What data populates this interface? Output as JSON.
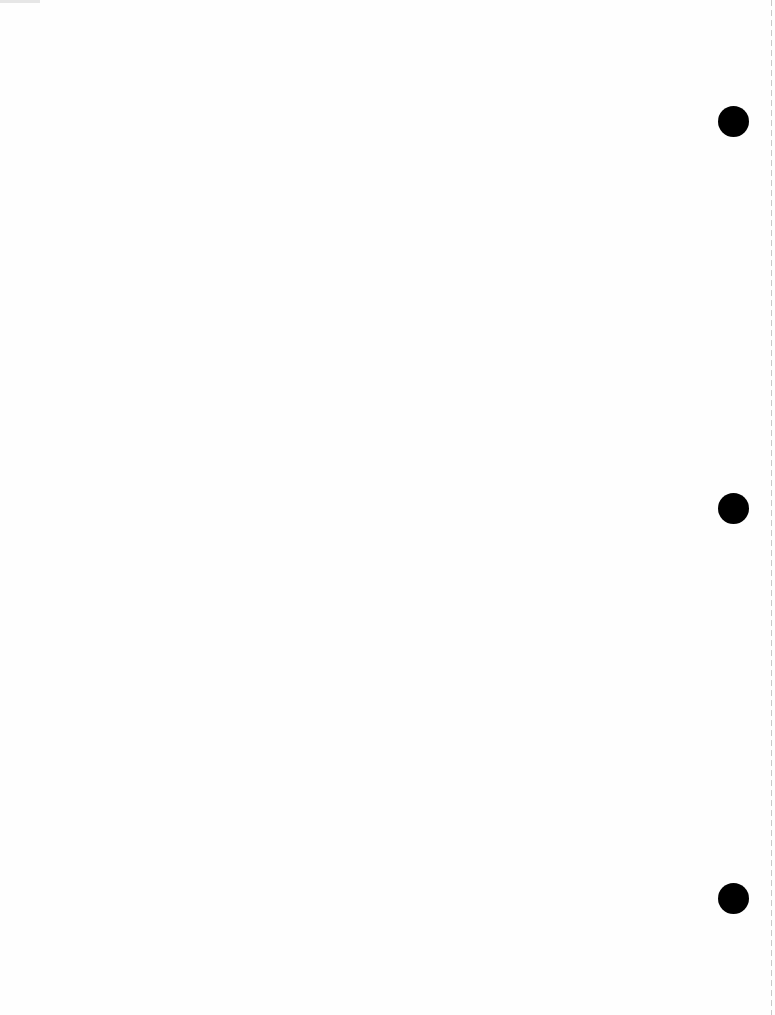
{
  "document": {
    "type": "blank scanned page",
    "text": "",
    "punch_holes": [
      {
        "cx": 733,
        "cy": 121
      },
      {
        "cx": 733,
        "cy": 508
      },
      {
        "cx": 733,
        "cy": 898
      }
    ],
    "colors": {
      "paper": "#fefefe",
      "hole": "#000000",
      "edge": "#c8c8c8"
    }
  }
}
